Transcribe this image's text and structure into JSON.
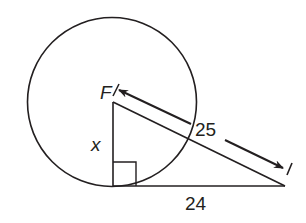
{
  "figure": {
    "stroke_color": "#231f20",
    "background": "#ffffff"
  },
  "labels": {
    "center": "F",
    "leg": "x",
    "hypotenuse": "25",
    "tangent": "24"
  },
  "geometry": {
    "circle": {
      "cx": 112,
      "cy": 102,
      "r": 84.5
    },
    "right_triangle": {
      "F": [
        113,
        102
      ],
      "tangent_point": [
        113,
        186
      ],
      "external_point": [
        284,
        186
      ],
      "right_angle_at": "tangent_point"
    },
    "measures": {
      "leg_x": "x",
      "hypotenuse": 25,
      "tangent_segment": 24
    }
  }
}
